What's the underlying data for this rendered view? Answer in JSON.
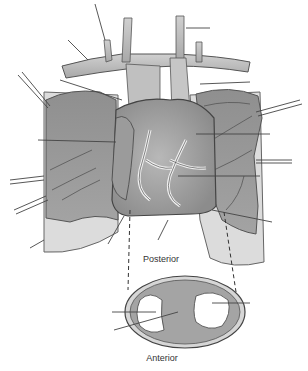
{
  "diagram": {
    "cross_section": {
      "top_label": "Posterior",
      "bottom_label": "Anterior"
    },
    "leader_line_count": 22,
    "colors": {
      "lung": "#9a9a9a",
      "lung_dark": "#7e7e7e",
      "pleura": "#d6d6d6",
      "vessel": "#bdbdbd",
      "heart": "#a8a8a8",
      "fat": "#e6e6e6",
      "outline": "#555555",
      "leader": "#444444"
    }
  }
}
